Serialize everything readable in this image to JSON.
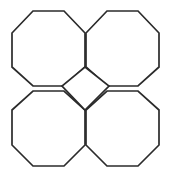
{
  "figure": {
    "title": "Truncated square tiling fragment",
    "canvas": {
      "width": 171,
      "height": 177,
      "background_color": "#ffffff"
    },
    "style": {
      "stroke_color": "#2b2b2b",
      "fill_color": "#ffffff",
      "stroke_width": 1.7
    },
    "shapes": [
      {
        "name": "octagon-top-left",
        "label": "Top-left octagon",
        "sides": 8,
        "points": "33,11 64,11 85,33 85,67 64,86 33,86 12,67 12,33"
      },
      {
        "name": "octagon-top-right",
        "label": "Top-right octagon",
        "sides": 8,
        "points": "107,11 138,11 159,33 159,67 138,86 107,86 86,67 86,33"
      },
      {
        "name": "octagon-bottom-left",
        "label": "Bottom-left octagon",
        "sides": 8,
        "points": "33,91 64,91 85,110 85,145 64,166 33,166 12,145 12,110"
      },
      {
        "name": "octagon-bottom-right",
        "label": "Bottom-right octagon",
        "sides": 8,
        "points": "107,91 138,91 159,110 159,145 138,166 107,166 86,145 86,110"
      },
      {
        "name": "square-center",
        "label": "Central rotated square",
        "sides": 4,
        "points": "85,67 109,86 85,110 62,86"
      }
    ]
  }
}
